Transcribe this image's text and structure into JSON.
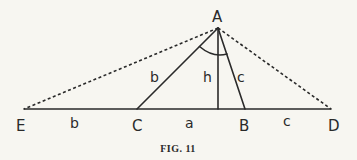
{
  "figure": {
    "caption": "FIG. 11",
    "points": {
      "A": {
        "label": "A",
        "x": 218,
        "y": 28
      },
      "B": {
        "label": "B",
        "x": 245,
        "y": 109
      },
      "C": {
        "label": "C",
        "x": 137,
        "y": 109
      },
      "D": {
        "label": "D",
        "x": 331,
        "y": 109
      },
      "E": {
        "label": "E",
        "x": 24,
        "y": 109
      },
      "H": {
        "label": "",
        "x": 218,
        "y": 109
      }
    },
    "segment_labels": {
      "AC": "b",
      "AH": "h",
      "AB": "c",
      "EC": "b",
      "CB": "a",
      "BD": "c"
    },
    "colors": {
      "ink": "#2a2a2a",
      "paper": "#f7f6f1"
    }
  }
}
